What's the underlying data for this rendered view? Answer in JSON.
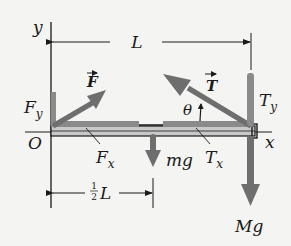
{
  "diagram": {
    "colors": {
      "background": "#f4f4f2",
      "vector": "#6e6e6e",
      "component": "#8a8a8a",
      "line": "#1a1a1a",
      "beam_fill": "#c8c8c8"
    },
    "axes": {
      "y_label": "y",
      "x_label": "x",
      "origin_label": "O"
    },
    "dimensions": {
      "full_length_label": "L",
      "half_length_num": "1",
      "half_length_den": "2",
      "half_length_var": "L"
    },
    "forces": {
      "F_vector": "F",
      "F_y": "F",
      "F_y_sub": "y",
      "F_x": "F",
      "F_x_sub": "x",
      "T_vector": "T",
      "T_y": "T",
      "T_y_sub": "y",
      "T_x": "T",
      "T_x_sub": "x",
      "theta": "θ",
      "beam_weight": "mg",
      "load_weight": "Mg"
    }
  }
}
